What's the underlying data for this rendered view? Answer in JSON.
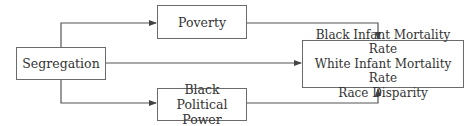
{
  "diagram": {
    "nodes": {
      "segregation": "Segregation",
      "poverty": "Poverty",
      "political_power": [
        "Black",
        "Political Power"
      ],
      "outcomes": [
        "Black Infant Mortality Rate",
        "White Infant Mortality Rate",
        "Race Disparity"
      ]
    },
    "edges": [
      {
        "from": "Segregation",
        "to": "Poverty"
      },
      {
        "from": "Segregation",
        "to": "Black Political Power"
      },
      {
        "from": "Segregation",
        "to": "Outcomes"
      },
      {
        "from": "Poverty",
        "to": "Outcomes"
      },
      {
        "from": "Black Political Power",
        "to": "Outcomes"
      }
    ],
    "colors": {
      "line": "#555555",
      "border": "#6b6b6b",
      "text": "#333333"
    }
  }
}
